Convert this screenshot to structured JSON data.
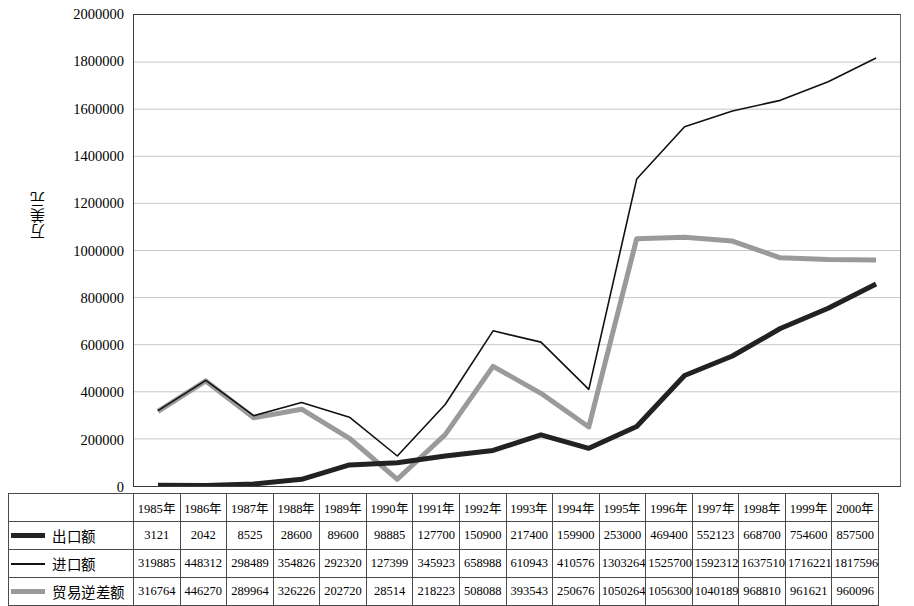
{
  "chart_data": {
    "type": "line",
    "title": "",
    "xlabel": "",
    "ylabel": "万美元",
    "ylim": [
      0,
      2000000
    ],
    "ytick_step": 200000,
    "yticks": [
      "2000000",
      "1800000",
      "1600000",
      "1400000",
      "1200000",
      "1000000",
      "800000",
      "600000",
      "400000",
      "200000",
      "0"
    ],
    "grid": true,
    "legend_position": "table-left",
    "categories": [
      "1985年",
      "1986年",
      "1987年",
      "1988年",
      "1989年",
      "1990年",
      "1991年",
      "1992年",
      "1993年",
      "1994年",
      "1995年",
      "1996年",
      "1997年",
      "1998年",
      "1999年",
      "2000年"
    ],
    "series": [
      {
        "name": "出口额",
        "color": "#222222",
        "style": "thick",
        "width": 5,
        "values": [
          3121,
          2042,
          8525,
          28600,
          89600,
          98885,
          127700,
          150900,
          217400,
          159900,
          253000,
          469400,
          552123,
          668700,
          754600,
          857500
        ]
      },
      {
        "name": "进口额",
        "color": "#111111",
        "style": "thin",
        "width": 1.6,
        "values": [
          319885,
          448312,
          298489,
          354826,
          292320,
          127399,
          345923,
          658988,
          610943,
          410576,
          1303264,
          1525700,
          1592312,
          1637510,
          1716221,
          1817596
        ]
      },
      {
        "name": "贸易逆差额",
        "color": "#9a9a9a",
        "style": "thick-gray",
        "width": 5,
        "values": [
          316764,
          446270,
          289964,
          326226,
          202720,
          28514,
          218223,
          508088,
          393543,
          250676,
          1050264,
          1056300,
          1040189,
          968810,
          961621,
          960096
        ]
      }
    ]
  },
  "table": {
    "empty_trailing_column": "",
    "corner_label": ""
  }
}
